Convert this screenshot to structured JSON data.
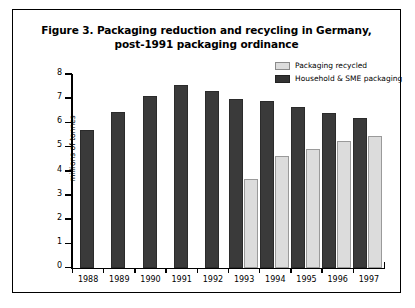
{
  "figure": {
    "title_line1": "Figure 3. Packaging reduction and recycling in Germany,",
    "title_line2": "post-1991 packaging ordinance"
  },
  "legend": {
    "items": [
      {
        "label": "Packaging recycled",
        "color": "#dcdcdc",
        "swatch": "light"
      },
      {
        "label": "Household & SME packaging",
        "color": "#3a3a3a",
        "swatch": "dark"
      }
    ]
  },
  "chart_data": {
    "type": "bar",
    "title": "Figure 3. Packaging reduction and recycling in Germany, post-1991 packaging ordinance",
    "xlabel": "",
    "ylabel": "millions of tonnes",
    "ylim": [
      0,
      8
    ],
    "yticks": [
      0,
      1,
      2,
      3,
      4,
      5,
      6,
      7,
      8
    ],
    "ytick_labels": [
      "0",
      "1",
      "2",
      "3",
      "4",
      "5",
      "6",
      "7",
      "8"
    ],
    "grid": false,
    "legend_position": "top-right",
    "categories": [
      "1988",
      "1989",
      "1990",
      "1991",
      "1992",
      "1993",
      "1994",
      "1995",
      "1996",
      "1997"
    ],
    "series": [
      {
        "name": "Household & SME packaging",
        "color": "#3a3a3a",
        "values": [
          5.7,
          6.45,
          7.1,
          7.55,
          7.3,
          6.95,
          6.9,
          6.65,
          6.4,
          6.2
        ]
      },
      {
        "name": "Packaging recycled",
        "color": "#dcdcdc",
        "values": [
          null,
          null,
          null,
          null,
          null,
          3.65,
          4.6,
          4.9,
          5.25,
          5.45
        ]
      }
    ]
  }
}
